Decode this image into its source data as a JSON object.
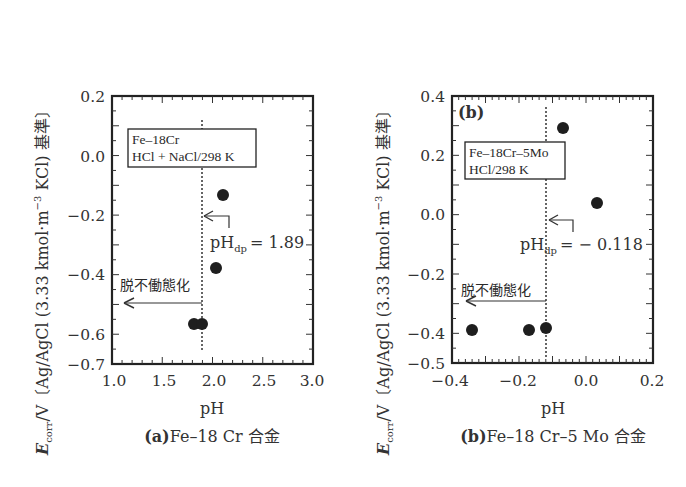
{
  "figure": {
    "ylabel": "E_corr/V〔Ag/AgCl (3.33 kmol·m⁻³ KCl) 基準〕",
    "ylabel_parts": {
      "symbol": "E",
      "sub": "corr",
      "rest": "/V〔Ag/AgCl (3.33 kmol·m",
      "sup": "−3",
      "tail": " KCl) 基準〕"
    }
  },
  "chart_data": [
    {
      "type": "scatter",
      "panel": "a",
      "title": "(a) Fe–18 Cr 合金",
      "caption_letter": "(a)",
      "caption_text": "Fe–18 Cr 合金",
      "xlabel": "pH",
      "ylabel": "E_corr/V〔Ag/AgCl (3.33 kmol·m⁻³ KCl) 基準〕",
      "xlim": [
        1.0,
        3.0
      ],
      "ylim": [
        -0.7,
        0.2
      ],
      "xticks": [
        "1.0",
        "1.5",
        "2.0",
        "2.5",
        "3.0"
      ],
      "yticks": [
        "0.2",
        "0.0",
        "−0.2",
        "−0.4",
        "−0.6",
        "−0.7"
      ],
      "legend_box": [
        "Fe–18Cr",
        "HCl + NaCl/298 K"
      ],
      "points": [
        {
          "x": 1.82,
          "y": -0.57
        },
        {
          "x": 1.9,
          "y": -0.57
        },
        {
          "x": 2.03,
          "y": -0.38
        },
        {
          "x": 2.1,
          "y": -0.13
        }
      ],
      "vline": {
        "x": 1.89,
        "style": "dotted"
      },
      "annotations": {
        "phdp_label": "pH",
        "phdp_sub": "dp",
        "phdp_value": "= 1.89",
        "depassivation": "脱不働態化"
      },
      "grid": false
    },
    {
      "type": "scatter",
      "panel": "b",
      "title": "(b) Fe–18 Cr–5 Mo 合金",
      "caption_letter": "(b)",
      "caption_text": "Fe–18 Cr–5 Mo 合金",
      "panel_tag": "(b)",
      "xlabel": "pH",
      "ylabel": "E_corr/V〔Ag/AgCl (3.33 kmol·m⁻³ KCl) 基準〕",
      "xlim": [
        -0.4,
        0.2
      ],
      "ylim": [
        -0.5,
        0.4
      ],
      "xticks": [
        "−0.4",
        "−0.2",
        "0.0",
        "0.2"
      ],
      "yticks": [
        "0.4",
        "0.2",
        "0.0",
        "−0.2",
        "−0.4",
        "−0.5"
      ],
      "legend_box": [
        "Fe–18Cr–5Mo",
        "HCl/298 K"
      ],
      "points": [
        {
          "x": -0.34,
          "y": -0.39
        },
        {
          "x": -0.17,
          "y": -0.39
        },
        {
          "x": -0.12,
          "y": -0.38
        },
        {
          "x": -0.07,
          "y": 0.29
        },
        {
          "x": 0.04,
          "y": 0.04
        }
      ],
      "vline": {
        "x": -0.118,
        "style": "dotted"
      },
      "annotations": {
        "phdp_label": "pH",
        "phdp_sub": "dp",
        "phdp_value": "= − 0.118",
        "depassivation": "脱不働態化"
      },
      "grid": false
    }
  ]
}
